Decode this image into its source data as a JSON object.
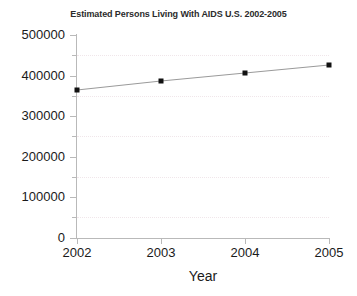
{
  "chart_data": {
    "type": "line",
    "title": "Estimated Persons Living With AIDS U.S. 2002-2005",
    "xlabel": "Year",
    "ylabel": "",
    "categories": [
      "2002",
      "2003",
      "2004",
      "2005"
    ],
    "x": [
      2002,
      2003,
      2004,
      2005
    ],
    "values": [
      364500,
      386700,
      406400,
      426100
    ],
    "series": [
      {
        "name": "Estimated Persons Living With AIDS",
        "values": [
          364500,
          386700,
          406400,
          426100
        ]
      }
    ],
    "xlim": [
      2002,
      2005
    ],
    "ylim": [
      0,
      500000
    ],
    "y_ticks": [
      0,
      100000,
      200000,
      300000,
      400000,
      500000
    ],
    "y_tick_labels": [
      "0",
      "100000",
      "200000",
      "300000",
      "400000",
      "500000"
    ],
    "y_minor_ticks": [
      50000,
      150000,
      250000,
      350000,
      450000
    ],
    "x_ticks": [
      2002,
      2003,
      2004,
      2005
    ],
    "x_tick_labels": [
      "2002",
      "2003",
      "2004",
      "2005"
    ],
    "grid": true,
    "grid_color": "#f0e6ea",
    "grid_style": "dotted",
    "legend": false,
    "legend_position": "none",
    "marker_style": "square",
    "marker_color": "#111111",
    "line_color": "#9a9a9a",
    "axis_color": "#b9b9b9",
    "background": "#ffffff"
  },
  "axis": {
    "y_labels": [
      "500000",
      "400000",
      "300000",
      "200000",
      "100000",
      "0"
    ],
    "x_labels": [
      "2002",
      "2003",
      "2004",
      "2005"
    ],
    "x_axis_title": "Year"
  }
}
